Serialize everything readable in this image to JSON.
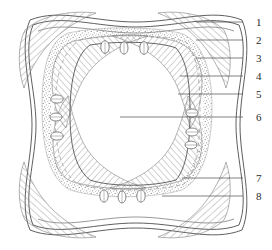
{
  "figure": {
    "kind": "anatomical-cross-section-diagram",
    "style": "line-drawing",
    "background_color": "#ffffff",
    "ink_color": "#4a4a4a",
    "hatch_color": "#8d8d8d",
    "stipple_color": "#9a9a9a",
    "dashed_color": "#9a9a9a"
  },
  "labels": [
    {
      "id": "1",
      "text": "1",
      "x": 256,
      "y": 17,
      "leader_from_x": 243,
      "leader_to_x": 196,
      "leader_y": 22
    },
    {
      "id": "2",
      "text": "2",
      "x": 256,
      "y": 35,
      "leader_from_x": 243,
      "leader_to_x": 196,
      "leader_y": 40
    },
    {
      "id": "3",
      "text": "3",
      "x": 256,
      "y": 53,
      "leader_from_x": 243,
      "leader_to_x": 196,
      "leader_y": 58
    },
    {
      "id": "4",
      "text": "4",
      "x": 256,
      "y": 71,
      "leader_from_x": 243,
      "leader_to_x": 180,
      "leader_y": 76
    },
    {
      "id": "5",
      "text": "5",
      "x": 256,
      "y": 89,
      "leader_from_x": 243,
      "leader_to_x": 178,
      "leader_y": 94
    },
    {
      "id": "6",
      "text": "6",
      "x": 256,
      "y": 112,
      "leader_from_x": 243,
      "leader_to_x": 120,
      "leader_y": 117
    },
    {
      "id": "7",
      "text": "7",
      "x": 256,
      "y": 173,
      "leader_from_x": 243,
      "leader_to_x": 182,
      "leader_y": 178
    },
    {
      "id": "8",
      "text": "8",
      "x": 256,
      "y": 191,
      "leader_from_x": 243,
      "leader_to_x": 162,
      "leader_y": 196
    }
  ],
  "structures": {
    "outer_contour_label": "outer concave-sided square boundary",
    "outer_corner_hatch_label": "hatched outer corner wedges",
    "stipple_band_label": "stippled intermediate band",
    "inner_hatch_label": "hatched inner layer",
    "dashed_boundary_label": "dashed inner boundary",
    "inner_cavity_label": "central cavity",
    "bud_label": "oval bud structure"
  },
  "buds": {
    "top_count": 3,
    "bottom_count": 3,
    "left_count": 3,
    "right_count": 3,
    "total": 12
  }
}
